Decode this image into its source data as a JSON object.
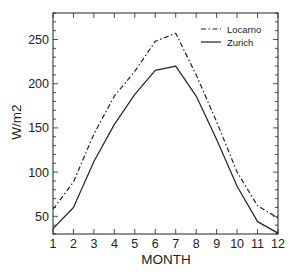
{
  "chart_data": {
    "type": "line",
    "title": "",
    "xlabel": "MONTH",
    "ylabel": "W/m2",
    "x": [
      1,
      2,
      3,
      4,
      5,
      6,
      7,
      8,
      9,
      10,
      11,
      12
    ],
    "xticks": [
      "1",
      "2",
      "3",
      "4",
      "5",
      "6",
      "7",
      "8",
      "9",
      "10",
      "11",
      "12"
    ],
    "yticks": [
      50,
      100,
      150,
      200,
      250
    ],
    "xlim": [
      1,
      12
    ],
    "ylim": [
      30,
      280
    ],
    "grid": false,
    "legend_position": "upper right",
    "series": [
      {
        "name": "Locarno",
        "style": "dash-dot",
        "color": "#222222",
        "values": [
          58,
          89,
          143,
          186,
          214,
          248,
          257,
          210,
          157,
          100,
          62,
          48
        ]
      },
      {
        "name": "Zurich",
        "style": "solid",
        "color": "#222222",
        "values": [
          36,
          60,
          112,
          154,
          188,
          215,
          220,
          186,
          137,
          84,
          44,
          31
        ]
      }
    ]
  }
}
